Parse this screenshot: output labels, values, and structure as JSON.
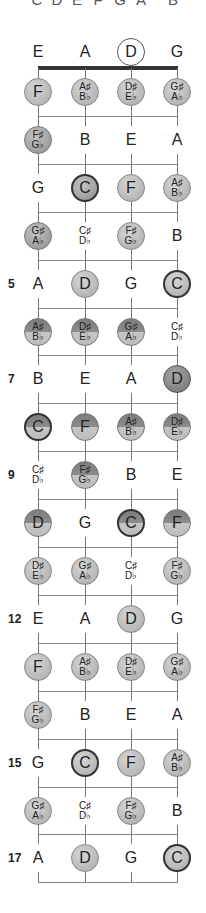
{
  "top_row": [
    "C",
    "D",
    "E",
    "F",
    "G",
    "A",
    "B"
  ],
  "strings": [
    "E",
    "A",
    "D",
    "G"
  ],
  "string_x": [
    38,
    85,
    131,
    177
  ],
  "colors": {
    "string": "#777777",
    "fret": "#8a8a8a",
    "nut": "#333333",
    "light": "#bdbdbd",
    "mid": "#a0a0a0",
    "dark": "#888888"
  },
  "open": {
    "y": 52,
    "notes": [
      {
        "label": "E",
        "style": "plain"
      },
      {
        "label": "A",
        "style": "plain"
      },
      {
        "label": "D",
        "style": "open-ring"
      },
      {
        "label": "G",
        "style": "plain"
      }
    ]
  },
  "nut_y": 68,
  "fret_rows": [
    {
      "fret": 1,
      "marker": "",
      "notes": [
        {
          "label": "F",
          "style": "c-light"
        },
        {
          "label": "A♯",
          "sub": "B♭",
          "style": "c-light"
        },
        {
          "label": "D♯",
          "sub": "E♭",
          "style": "c-light"
        },
        {
          "label": "G♯",
          "sub": "A♭",
          "style": "c-light"
        }
      ]
    },
    {
      "fret": 2,
      "marker": "",
      "notes": [
        {
          "label": "F♯",
          "sub": "G♭",
          "style": "c-mid"
        },
        {
          "label": "B",
          "style": "plain"
        },
        {
          "label": "E",
          "style": "plain"
        },
        {
          "label": "A",
          "style": "plain"
        }
      ]
    },
    {
      "fret": 3,
      "marker": "",
      "notes": [
        {
          "label": "G",
          "style": "plain"
        },
        {
          "label": "C",
          "style": "c-mid",
          "root": true
        },
        {
          "label": "F",
          "style": "c-light"
        },
        {
          "label": "A♯",
          "sub": "B♭",
          "style": "c-light"
        }
      ]
    },
    {
      "fret": 4,
      "marker": "",
      "notes": [
        {
          "label": "G♯",
          "sub": "A♭",
          "style": "c-mid"
        },
        {
          "label": "C♯",
          "sub": "D♭",
          "style": "plain"
        },
        {
          "label": "F♯",
          "sub": "G♭",
          "style": "c-light"
        },
        {
          "label": "B",
          "style": "plain"
        }
      ]
    },
    {
      "fret": 5,
      "marker": "5",
      "notes": [
        {
          "label": "A",
          "style": "plain"
        },
        {
          "label": "D",
          "style": "c-light"
        },
        {
          "label": "G",
          "style": "plain"
        },
        {
          "label": "C",
          "style": "c-light",
          "root": true
        }
      ]
    },
    {
      "fret": 6,
      "marker": "",
      "notes": [
        {
          "label": "A♯",
          "sub": "B♭",
          "style": "c-split"
        },
        {
          "label": "D♯",
          "sub": "E♭",
          "style": "c-split"
        },
        {
          "label": "G♯",
          "sub": "A♭",
          "style": "c-split"
        },
        {
          "label": "C♯",
          "sub": "D♭",
          "style": "plain"
        }
      ]
    },
    {
      "fret": 7,
      "marker": "7",
      "notes": [
        {
          "label": "B",
          "style": "plain"
        },
        {
          "label": "E",
          "style": "plain"
        },
        {
          "label": "A",
          "style": "plain"
        },
        {
          "label": "D",
          "style": "c-dark"
        }
      ]
    },
    {
      "fret": 8,
      "marker": "",
      "notes": [
        {
          "label": "C",
          "style": "c-split",
          "root": true
        },
        {
          "label": "F",
          "style": "c-split"
        },
        {
          "label": "A♯",
          "sub": "B♭",
          "style": "c-split"
        },
        {
          "label": "D♯",
          "sub": "E♭",
          "style": "c-split"
        }
      ]
    },
    {
      "fret": 9,
      "marker": "9",
      "notes": [
        {
          "label": "C♯",
          "sub": "D♭",
          "style": "plain"
        },
        {
          "label": "F♯",
          "sub": "G♭",
          "style": "c-split"
        },
        {
          "label": "B",
          "style": "plain"
        },
        {
          "label": "E",
          "style": "plain"
        }
      ]
    },
    {
      "fret": 10,
      "marker": "",
      "notes": [
        {
          "label": "D",
          "style": "c-split"
        },
        {
          "label": "G",
          "style": "plain"
        },
        {
          "label": "C",
          "style": "c-split",
          "root": true
        },
        {
          "label": "F",
          "style": "c-split"
        }
      ]
    },
    {
      "fret": 11,
      "marker": "",
      "notes": [
        {
          "label": "D♯",
          "sub": "E♭",
          "style": "c-light"
        },
        {
          "label": "G♯",
          "sub": "A♭",
          "style": "c-light"
        },
        {
          "label": "C♯",
          "sub": "D♭",
          "style": "plain"
        },
        {
          "label": "F♯",
          "sub": "G♭",
          "style": "c-light"
        }
      ]
    },
    {
      "fret": 12,
      "marker": "12",
      "notes": [
        {
          "label": "E",
          "style": "plain"
        },
        {
          "label": "A",
          "style": "plain"
        },
        {
          "label": "D",
          "style": "c-light"
        },
        {
          "label": "G",
          "style": "plain"
        }
      ]
    },
    {
      "fret": 13,
      "marker": "",
      "notes": [
        {
          "label": "F",
          "style": "c-light"
        },
        {
          "label": "A♯",
          "sub": "B♭",
          "style": "c-light"
        },
        {
          "label": "D♯",
          "sub": "E♭",
          "style": "c-light"
        },
        {
          "label": "G♯",
          "sub": "A♭",
          "style": "c-light"
        }
      ]
    },
    {
      "fret": 14,
      "marker": "",
      "notes": [
        {
          "label": "F♯",
          "sub": "G♭",
          "style": "c-light"
        },
        {
          "label": "B",
          "style": "plain"
        },
        {
          "label": "E",
          "style": "plain"
        },
        {
          "label": "A",
          "style": "plain"
        }
      ]
    },
    {
      "fret": 15,
      "marker": "15",
      "notes": [
        {
          "label": "G",
          "style": "plain"
        },
        {
          "label": "C",
          "style": "c-light",
          "root": true
        },
        {
          "label": "F",
          "style": "c-light"
        },
        {
          "label": "A♯",
          "sub": "B♭",
          "style": "c-light"
        }
      ]
    },
    {
      "fret": 16,
      "marker": "",
      "notes": [
        {
          "label": "G♯",
          "sub": "A♭",
          "style": "c-light"
        },
        {
          "label": "C♯",
          "sub": "D♭",
          "style": "plain"
        },
        {
          "label": "F♯",
          "sub": "G♭",
          "style": "c-light"
        },
        {
          "label": "B",
          "style": "plain"
        }
      ]
    },
    {
      "fret": 17,
      "marker": "17",
      "notes": [
        {
          "label": "A",
          "style": "plain"
        },
        {
          "label": "D",
          "style": "c-light"
        },
        {
          "label": "G",
          "style": "plain"
        },
        {
          "label": "C",
          "style": "c-light",
          "root": true
        }
      ]
    }
  ],
  "first_row_y": 92,
  "row_spacing": 47.9
}
